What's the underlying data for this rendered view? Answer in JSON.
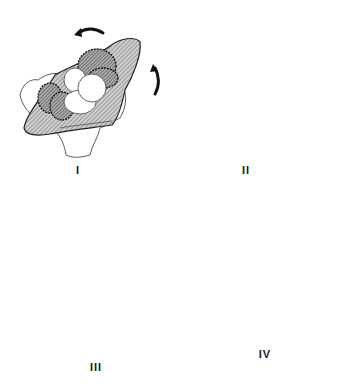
{
  "figure": {
    "type": "multi-panel schematic",
    "background_color": "#ffffff",
    "hatch_color": "#555555",
    "outline_color": "#222222",
    "panels": [
      {
        "id": "I",
        "label": "I",
        "rotation_arrows": [
          "counterclockwise-top",
          "counterclockwise-right"
        ]
      },
      {
        "id": "II",
        "label": "II",
        "rotation_arrows": [
          "counterclockwise-top",
          "counterclockwise-right"
        ]
      },
      {
        "id": "III",
        "label": "III",
        "rotation_arrows": [
          "counterclockwise-top",
          "counterclockwise-right"
        ]
      },
      {
        "id": "IV",
        "label": "IV",
        "rotation_arrows": [
          "counterclockwise-left",
          "counterclockwise-bottom"
        ]
      }
    ]
  }
}
